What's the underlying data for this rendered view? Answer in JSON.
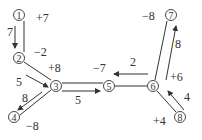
{
  "diagram": {
    "type": "network flow graph",
    "nodes": [
      {
        "id": "1",
        "label": "①",
        "x": 19,
        "y": 15
      },
      {
        "id": "2",
        "label": "②",
        "x": 19,
        "y": 58
      },
      {
        "id": "3",
        "label": "③",
        "x": 56,
        "y": 86
      },
      {
        "id": "4",
        "label": "④",
        "x": 14,
        "y": 117
      },
      {
        "id": "5",
        "label": "⑤",
        "x": 109,
        "y": 86
      },
      {
        "id": "6",
        "label": "⑥",
        "x": 153,
        "y": 86
      },
      {
        "id": "7",
        "label": "⑦",
        "x": 171,
        "y": 15
      },
      {
        "id": "8",
        "label": "⑧",
        "x": 180,
        "y": 117
      }
    ],
    "edges": [
      {
        "from": "1",
        "to": "2",
        "flow": "7",
        "cost_label": "+7",
        "reverse_label": "-2"
      },
      {
        "from": "2",
        "to": "3",
        "flow": "5",
        "cost_label": "+8"
      },
      {
        "from": "3",
        "to": "4",
        "flow": "8",
        "cost_label": "-8"
      },
      {
        "from": "3",
        "to": "5",
        "flow": "5",
        "cost_label": "-7"
      },
      {
        "from": "6",
        "to": "5",
        "flow": "2"
      },
      {
        "from": "6",
        "to": "7",
        "flow": "8",
        "cost_label": "-8"
      },
      {
        "from": "8",
        "to": "6",
        "flow": "4",
        "cost_label": "+6",
        "extra_label": "+4"
      }
    ],
    "labels": [
      {
        "text": "+7",
        "x": 36,
        "y": 22
      },
      {
        "text": "7",
        "x": 7,
        "y": 36
      },
      {
        "text": "−2",
        "x": 34,
        "y": 56
      },
      {
        "text": "+8",
        "x": 48,
        "y": 72
      },
      {
        "text": "5",
        "x": 16,
        "y": 86
      },
      {
        "text": "8",
        "x": 22,
        "y": 102
      },
      {
        "text": "−8",
        "x": 26,
        "y": 130
      },
      {
        "text": "5",
        "x": 75,
        "y": 104
      },
      {
        "text": "−7",
        "x": 93,
        "y": 72
      },
      {
        "text": "2",
        "x": 130,
        "y": 66
      },
      {
        "text": "−8",
        "x": 142,
        "y": 20
      },
      {
        "text": "8",
        "x": 175,
        "y": 48
      },
      {
        "text": "+6",
        "x": 170,
        "y": 81
      },
      {
        "text": "4",
        "x": 184,
        "y": 101
      },
      {
        "text": "+4",
        "x": 153,
        "y": 125
      }
    ]
  }
}
